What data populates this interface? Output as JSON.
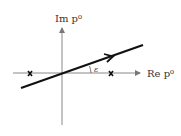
{
  "diagram": {
    "y_axis_label": "Im p⁰",
    "x_axis_label": "Re p⁰",
    "angle_label": "ε",
    "poles": [
      {
        "name": "left-pole",
        "symbol": "×"
      },
      {
        "name": "right-pole",
        "symbol": "×"
      }
    ],
    "contour": "tilted integration contour rotated by angle ε"
  }
}
